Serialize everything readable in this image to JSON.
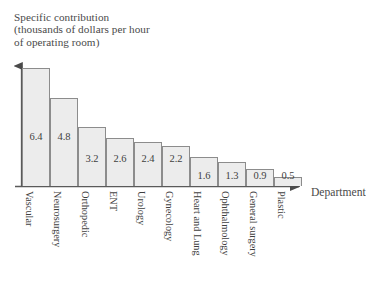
{
  "chart_data": {
    "type": "bar",
    "title": "Specific contribution (thousands of dollars per hour of operating room)",
    "title_lines": [
      "Specific contribution",
      "(thousands of dollars per hour",
      "of operating room)"
    ],
    "xlabel": "Department",
    "ylabel": "Specific contribution (thousands of dollars per hour of operating room)",
    "categories": [
      "Vascular",
      "Neurosurgery",
      "Orthopedic",
      "ENT",
      "Urology",
      "Gynecology",
      "Heart and Lung",
      "Ophthalmology",
      "General surgery",
      "Plastic"
    ],
    "values": [
      6.4,
      4.8,
      3.2,
      2.6,
      2.4,
      2.2,
      1.6,
      1.3,
      0.9,
      0.5
    ],
    "value_labels": [
      "6.4",
      "4.8",
      "3.2",
      "2.6",
      "2.4",
      "2.2",
      "1.6",
      "1.3",
      "0.9",
      "0.5"
    ],
    "ylim": [
      0,
      6.9
    ],
    "xlim_categories": 10,
    "grid": false,
    "legend": null,
    "tick_labels_y": [],
    "axis_style": "arrow-tipped",
    "bar_fill": "#ececec",
    "bar_border": "#8c8c8c",
    "axis_color": "#5a5a5a",
    "text_color": "#3f3f3f"
  }
}
